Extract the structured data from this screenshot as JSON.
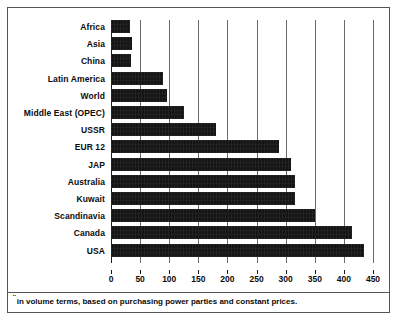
{
  "chart_data": {
    "type": "bar",
    "orientation": "horizontal",
    "title": "",
    "xlabel": "",
    "ylabel": "",
    "xlim": [
      0,
      450
    ],
    "xticks": [
      0,
      50,
      100,
      150,
      200,
      250,
      300,
      350,
      400,
      450
    ],
    "grid": true,
    "legend": null,
    "bar_color": "#141414",
    "categories": [
      "Africa",
      "Asia",
      "China",
      "Latin America",
      "World",
      "Middle East (OPEC)",
      "USSR",
      "EUR 12",
      "JAP",
      "Australia",
      "Kuwait",
      "Scandinavia",
      "Canada",
      "USA"
    ],
    "values": [
      32,
      36,
      34,
      90,
      96,
      126,
      181,
      288,
      310,
      316,
      316,
      350,
      414,
      434
    ]
  },
  "footnote": {
    "marker": "¨",
    "text": "in volume terms, based on purchasing power parties and constant prices."
  }
}
